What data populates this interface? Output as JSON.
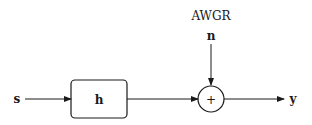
{
  "diagram": {
    "title": "AWGR",
    "input_label": "s",
    "block_label": "h",
    "noise_label": "n",
    "adder_symbol": "+",
    "output_label": "y",
    "colors": {
      "stroke": "#1a1a1a",
      "background": "#ffffff"
    }
  }
}
